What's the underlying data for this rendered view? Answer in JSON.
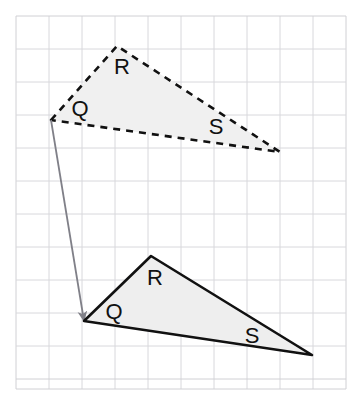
{
  "figure": {
    "canvas": {
      "width": 364,
      "height": 409,
      "background": "#ffffff"
    },
    "grid": {
      "x0": 16,
      "y0": 16,
      "x1": 346,
      "y1": 389,
      "cell": 33,
      "columns": 10,
      "rows": 11,
      "line_color": "#d8d8dc",
      "border_color": "#d0d0d4"
    },
    "shapes": [
      {
        "name": "preimage-triangle",
        "style": "dashed",
        "stroke": "#111111",
        "fill": "#f0f0f0",
        "stroke_width": 2.6,
        "dash": "7 6",
        "vertices": [
          {
            "label": "Q",
            "x": 51,
            "y": 120
          },
          {
            "label": "R",
            "x": 117,
            "y": 46
          },
          {
            "label": "S",
            "x": 280,
            "y": 152
          }
        ],
        "labels": [
          {
            "text": "R",
            "x": 122,
            "y": 68
          },
          {
            "text": "Q",
            "x": 80,
            "y": 110
          },
          {
            "text": "S",
            "x": 216,
            "y": 128
          }
        ]
      },
      {
        "name": "image-triangle",
        "style": "solid",
        "stroke": "#111111",
        "fill": "#eeeeee",
        "stroke_width": 2.6,
        "dash": "none",
        "vertices": [
          {
            "label": "Q",
            "x": 84,
            "y": 321
          },
          {
            "label": "R",
            "x": 151,
            "y": 256
          },
          {
            "label": "S",
            "x": 312,
            "y": 355
          }
        ],
        "labels": [
          {
            "text": "R",
            "x": 155,
            "y": 279
          },
          {
            "text": "Q",
            "x": 114,
            "y": 313
          },
          {
            "text": "S",
            "x": 252,
            "y": 337
          }
        ]
      }
    ],
    "arrow": {
      "name": "translation-vector",
      "color": "#808088",
      "stroke_width": 1.8,
      "from_x": 51,
      "from_y": 120,
      "to_x": 84,
      "to_y": 321
    }
  }
}
